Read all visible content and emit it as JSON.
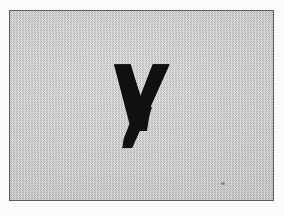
{
  "image": {
    "kind": "scanned-letter-specimen",
    "caption": "y",
    "description": "Bold lowercase letter y on dithered gray background inside a thin rectangular frame"
  },
  "frame": {
    "name": "specimen-frame",
    "x": 9,
    "y": 10,
    "width": 265,
    "height": 191,
    "border_color": "#5d5d5d",
    "border_width": 1.5
  },
  "background": {
    "page_color": "#fdfdfd",
    "fill_color": "#c6c6c6",
    "dither_light": "#d8d8d8",
    "dither_dark": "#b2b2b2",
    "pattern": "halftone-checkerboard"
  },
  "glyph": {
    "character": "y",
    "case": "lowercase",
    "weight": "bold",
    "color": "#101010",
    "bounds": {
      "x": 113,
      "y": 63,
      "width": 56,
      "height": 84
    },
    "strokes": {
      "left_arm_top_x": 113,
      "right_arm_top_x": 152,
      "junction_y": 118,
      "descender_tip_x": 122,
      "descender_tip_y": 147
    }
  },
  "artifacts": {
    "dust_speck": {
      "x": 220,
      "y": 181,
      "width": 4,
      "height": 3,
      "color": "#3c3c3c"
    }
  }
}
